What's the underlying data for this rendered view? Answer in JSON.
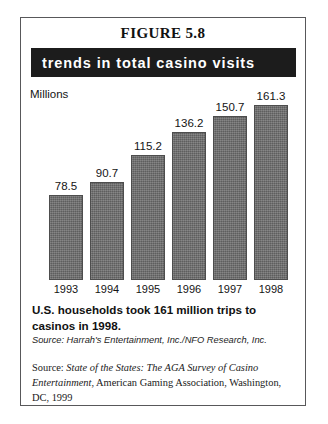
{
  "figure": {
    "heading": "FIGURE 5.8",
    "banner_title": "trends in total casino visits",
    "caption": "U.S. households took 161 million trips to casinos in 1998.",
    "source_primary": "Source: Harrah's Entertainment, Inc./NFO Research, Inc.",
    "source_secondary": {
      "prefix": "Source: ",
      "italic_title": "State of the States: The AGA Survey of Casino Entertainment",
      "rest": ", American Gaming Association, Washington, DC, 1999"
    }
  },
  "colors": {
    "banner_background": "#1c1c1c",
    "banner_text": "#ffffff",
    "bar_fill": "#6b6b6b",
    "border": "#58585a",
    "page_background": "#ffffff"
  },
  "chart_data": {
    "type": "bar",
    "title": "trends in total casino visits",
    "categories": [
      "1993",
      "1994",
      "1995",
      "1996",
      "1997",
      "1998"
    ],
    "values": [
      78.5,
      90.7,
      115.2,
      136.2,
      150.7,
      161.3
    ],
    "data_labels": [
      "78.5",
      "90.7",
      "115.2",
      "136.2",
      "150.7",
      "161.3"
    ],
    "xlabel": "",
    "ylabel": "Millions",
    "ylim": [
      0,
      175
    ],
    "grid": false,
    "legend": null
  }
}
